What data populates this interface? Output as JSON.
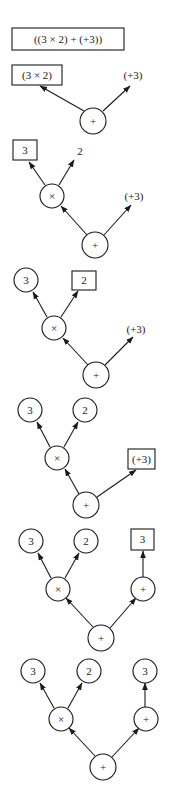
{
  "diagram": {
    "stroke_color": "#1a1a1a",
    "background": "#ffffff",
    "stages": [
      {
        "id": "stage-1",
        "nodes": [
          {
            "id": "expr",
            "kind": "box",
            "label": "((3 × 2) + (+3))",
            "x": 12,
            "y": 28,
            "w": 112,
            "h": 22,
            "fs": 11
          }
        ],
        "edges": []
      },
      {
        "id": "stage-2",
        "nodes": [
          {
            "id": "left",
            "kind": "box",
            "label": "(3 × 2)",
            "x": 12,
            "y": 65,
            "w": 50,
            "h": 20,
            "fs": 11
          },
          {
            "id": "right",
            "kind": "text",
            "label": "(+3)",
            "x": 133,
            "y": 79,
            "fs": 11
          },
          {
            "id": "root",
            "kind": "circle",
            "label": "+",
            "x": 93,
            "y": 121,
            "r": 13,
            "fs": 11
          }
        ],
        "edges": [
          {
            "from": [
              84,
              111
            ],
            "to": [
              40,
              86
            ]
          },
          {
            "from": [
              103,
              111
            ],
            "to": [
              130,
              86
            ]
          }
        ]
      },
      {
        "id": "stage-3",
        "nodes": [
          {
            "id": "three",
            "kind": "box",
            "label": "3",
            "x": 13,
            "y": 140,
            "w": 24,
            "h": 20,
            "fs": 11
          },
          {
            "id": "two",
            "kind": "text",
            "label": "2",
            "x": 80,
            "y": 155,
            "fs": 11
          },
          {
            "id": "times",
            "kind": "circle",
            "label": "×",
            "x": 52,
            "y": 196,
            "r": 12,
            "fs": 11
          },
          {
            "id": "right",
            "kind": "text",
            "label": "(+3)",
            "x": 134,
            "y": 200,
            "fs": 11
          },
          {
            "id": "root",
            "kind": "circle",
            "label": "+",
            "x": 95,
            "y": 245,
            "r": 13,
            "fs": 11
          }
        ],
        "edges": [
          {
            "from": [
              45,
              185
            ],
            "to": [
              29,
              162
            ]
          },
          {
            "from": [
              59,
              185
            ],
            "to": [
              74,
              160
            ]
          },
          {
            "from": [
              87,
              235
            ],
            "to": [
              61,
              206
            ]
          },
          {
            "from": [
              104,
              235
            ],
            "to": [
              131,
              205
            ]
          }
        ]
      },
      {
        "id": "stage-4",
        "nodes": [
          {
            "id": "three",
            "kind": "circle",
            "label": "3",
            "x": 26,
            "y": 280,
            "r": 12,
            "fs": 11
          },
          {
            "id": "two",
            "kind": "box",
            "label": "2",
            "x": 72,
            "y": 271,
            "w": 24,
            "h": 19,
            "fs": 11
          },
          {
            "id": "times",
            "kind": "circle",
            "label": "×",
            "x": 54,
            "y": 328,
            "r": 12,
            "fs": 11
          },
          {
            "id": "right",
            "kind": "text",
            "label": "(+3)",
            "x": 136,
            "y": 333,
            "fs": 11
          },
          {
            "id": "root",
            "kind": "circle",
            "label": "+",
            "x": 96,
            "y": 375,
            "r": 13,
            "fs": 11
          }
        ],
        "edges": [
          {
            "from": [
              47,
              317
            ],
            "to": [
              33,
              292
            ]
          },
          {
            "from": [
              61,
              317
            ],
            "to": [
              78,
              291
            ]
          },
          {
            "from": [
              88,
              365
            ],
            "to": [
              63,
              338
            ]
          },
          {
            "from": [
              105,
              365
            ],
            "to": [
              133,
              337
            ]
          }
        ]
      },
      {
        "id": "stage-5",
        "nodes": [
          {
            "id": "three",
            "kind": "circle",
            "label": "3",
            "x": 30,
            "y": 410,
            "r": 12,
            "fs": 11
          },
          {
            "id": "two",
            "kind": "circle",
            "label": "2",
            "x": 85,
            "y": 410,
            "r": 12,
            "fs": 11
          },
          {
            "id": "times",
            "kind": "circle",
            "label": "×",
            "x": 57,
            "y": 458,
            "r": 12,
            "fs": 11
          },
          {
            "id": "right",
            "kind": "box",
            "label": "(+3)",
            "x": 128,
            "y": 449,
            "w": 27,
            "h": 20,
            "fs": 11
          },
          {
            "id": "root",
            "kind": "circle",
            "label": "+",
            "x": 86,
            "y": 505,
            "r": 13,
            "fs": 11
          }
        ],
        "edges": [
          {
            "from": [
              50,
              447
            ],
            "to": [
              37,
              422
            ]
          },
          {
            "from": [
              64,
              447
            ],
            "to": [
              78,
              422
            ]
          },
          {
            "from": [
              79,
              494
            ],
            "to": [
              65,
              469
            ]
          },
          {
            "from": [
              97,
              497
            ],
            "to": [
              136,
              470
            ]
          }
        ]
      },
      {
        "id": "stage-6",
        "nodes": [
          {
            "id": "three",
            "kind": "circle",
            "label": "3",
            "x": 31,
            "y": 541,
            "r": 12,
            "fs": 11
          },
          {
            "id": "two",
            "kind": "circle",
            "label": "2",
            "x": 86,
            "y": 541,
            "r": 12,
            "fs": 11
          },
          {
            "id": "three-right",
            "kind": "box",
            "label": "3",
            "x": 131,
            "y": 529,
            "w": 23,
            "h": 21,
            "fs": 11
          },
          {
            "id": "times",
            "kind": "circle",
            "label": "×",
            "x": 58,
            "y": 589,
            "r": 12,
            "fs": 11
          },
          {
            "id": "unary-plus",
            "kind": "circle",
            "label": "+",
            "x": 143,
            "y": 589,
            "r": 12,
            "fs": 11
          },
          {
            "id": "root",
            "kind": "circle",
            "label": "+",
            "x": 101,
            "y": 638,
            "r": 13,
            "fs": 11
          }
        ],
        "edges": [
          {
            "from": [
              51,
              578
            ],
            "to": [
              38,
              553
            ]
          },
          {
            "from": [
              65,
              578
            ],
            "to": [
              79,
              553
            ]
          },
          {
            "from": [
              143,
              577
            ],
            "to": [
              143,
              551
            ]
          },
          {
            "from": [
              93,
              627
            ],
            "to": [
              66,
              598
            ]
          },
          {
            "from": [
              110,
              628
            ],
            "to": [
              136,
              598
            ]
          }
        ]
      },
      {
        "id": "stage-7",
        "nodes": [
          {
            "id": "three",
            "kind": "circle",
            "label": "3",
            "x": 33,
            "y": 671,
            "r": 12,
            "fs": 11
          },
          {
            "id": "two",
            "kind": "circle",
            "label": "2",
            "x": 89,
            "y": 671,
            "r": 12,
            "fs": 11
          },
          {
            "id": "three-right",
            "kind": "circle",
            "label": "3",
            "x": 145,
            "y": 671,
            "r": 12,
            "fs": 11
          },
          {
            "id": "times",
            "kind": "circle",
            "label": "×",
            "x": 61,
            "y": 719,
            "r": 12,
            "fs": 11
          },
          {
            "id": "unary-plus",
            "kind": "circle",
            "label": "+",
            "x": 146,
            "y": 719,
            "r": 12,
            "fs": 11
          },
          {
            "id": "root",
            "kind": "circle",
            "label": "+",
            "x": 103,
            "y": 767,
            "r": 13,
            "fs": 11
          }
        ],
        "edges": [
          {
            "from": [
              54,
              708
            ],
            "to": [
              40,
              683
            ]
          },
          {
            "from": [
              68,
              708
            ],
            "to": [
              82,
              683
            ]
          },
          {
            "from": [
              145,
              707
            ],
            "to": [
              145,
              683
            ]
          },
          {
            "from": [
              95,
              756
            ],
            "to": [
              69,
              728
            ]
          },
          {
            "from": [
              112,
              757
            ],
            "to": [
              139,
              728
            ]
          }
        ]
      }
    ]
  }
}
